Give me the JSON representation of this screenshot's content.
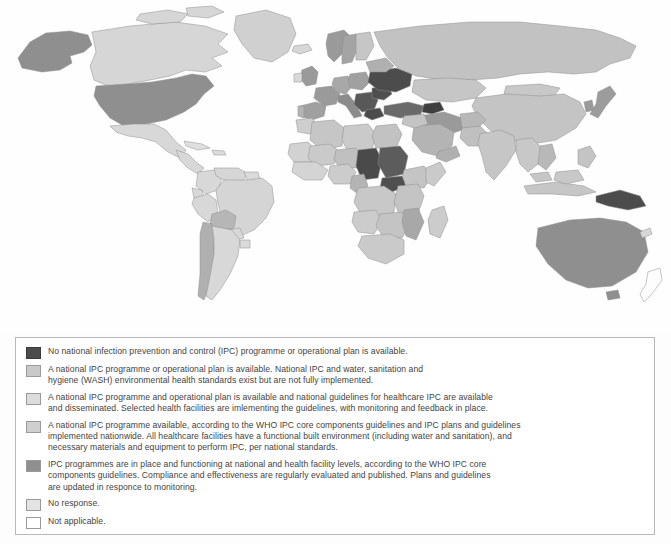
{
  "map": {
    "title": "World map of national IPC programme status",
    "projection": "world-equirectangular",
    "background_color": "#fefefe",
    "border_color": "#8e8e8e",
    "categories": [
      {
        "key": "level0",
        "color": "#4c4c4c",
        "label": "No national infection prevention and control (IPC) programme or operational plan is available."
      },
      {
        "key": "level1",
        "color": "#c9c9c9",
        "label": "A national IPC programme or operational plan is available."
      },
      {
        "key": "level2",
        "color": "#d6d6d6",
        "label": "A national IPC programme and operational plan is available."
      },
      {
        "key": "level3",
        "color": "#bdbdbd",
        "label": "A national IPC programme available per WHO core components."
      },
      {
        "key": "level4",
        "color": "#8f8f8f",
        "label": "IPC programmes are in place and functioning."
      },
      {
        "key": "no_response",
        "color": "#e3e3e3",
        "label": "No response."
      },
      {
        "key": "not_applicable",
        "color": "#ffffff",
        "label": "Not applicable."
      }
    ]
  },
  "legend": {
    "items": [
      {
        "swatch_color": "#4c4c4c",
        "lines": [
          "No national infection prevention and control (IPC) programme or operational plan is available."
        ]
      },
      {
        "swatch_color": "#c9c9c9",
        "lines": [
          "A national IPC programme or operational plan is available. National IPC and water, sanitation and",
          "hygiene (WASH) environmental health standards exist but are not fully implemented."
        ]
      },
      {
        "swatch_color": "#dcdcdc",
        "lines": [
          "A national IPC programme and operational plan is available and national guidelines for healthcare IPC are available",
          "and disseminated. Selected health facilities are imlementing the guidelines, with monitoring and feedback in place."
        ]
      },
      {
        "swatch_color": "#cfcfcf",
        "lines": [
          "A national IPC programme available, according to the WHO IPC core components guidelines and IPC plans and guidelines",
          "implemented nationwide. All healthcare facilities have a functional built environment (including water and sanitation), and",
          "necessary materials and equipment to perform IPC, per national standards."
        ]
      },
      {
        "swatch_color": "#8f8f8f",
        "lines": [
          "IPC programmes are in place and functioning at national and health facility levels, according to the WHO IPC core",
          "components guidelines. Compliance and effectiveness are regularly evaluated and published. Plans and guidelines",
          "are updated in responce to monitoring."
        ]
      },
      {
        "swatch_color": "#e3e3e3",
        "lines": [
          "No response."
        ]
      },
      {
        "swatch_color": "#ffffff",
        "lines": [
          "Not applicable."
        ]
      }
    ]
  }
}
